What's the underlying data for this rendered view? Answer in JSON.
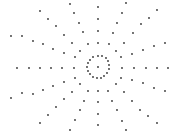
{
  "figure": {
    "width": 174,
    "height": 138,
    "background": "#ffffff",
    "dot_color": "#333333",
    "dot_radius": 0.9,
    "center": [
      98,
      67
    ],
    "inner_ring": [
      [
        98,
        56
      ],
      [
        102,
        56
      ],
      [
        106,
        58
      ],
      [
        108,
        61
      ],
      [
        109,
        65
      ],
      [
        109,
        69
      ],
      [
        107,
        73
      ],
      [
        104,
        76
      ],
      [
        101,
        78
      ],
      [
        97,
        78
      ],
      [
        93,
        77
      ],
      [
        90,
        74
      ],
      [
        88,
        71
      ],
      [
        87,
        67
      ],
      [
        88,
        63
      ],
      [
        90,
        60
      ],
      [
        93,
        57
      ]
    ],
    "center_dot": [
      98,
      67
    ],
    "rays": [
      [
        [
          98,
          43
        ],
        [
          98,
          31
        ],
        [
          98,
          19
        ],
        [
          98,
          7
        ]
      ],
      [
        [
          98,
          91
        ],
        [
          98,
          102
        ],
        [
          98,
          114
        ],
        [
          98,
          125
        ]
      ],
      [
        [
          74,
          68
        ],
        [
          62,
          68
        ],
        [
          51,
          68
        ],
        [
          40,
          68
        ],
        [
          29,
          68
        ],
        [
          17,
          68
        ]
      ],
      [
        [
          122,
          68
        ],
        [
          134,
          68
        ],
        [
          146,
          68
        ],
        [
          157,
          68
        ],
        [
          168,
          68
        ]
      ],
      [
        [
          88,
          44
        ],
        [
          83,
          32
        ],
        [
          79,
          23
        ],
        [
          74,
          13
        ],
        [
          70,
          4
        ]
      ],
      [
        [
          109,
          44
        ],
        [
          113,
          33
        ],
        [
          117,
          23
        ],
        [
          122,
          13
        ],
        [
          126,
          3
        ]
      ],
      [
        [
          80,
          51
        ],
        [
          72,
          43
        ],
        [
          64,
          35
        ],
        [
          56,
          26
        ],
        [
          48,
          19
        ],
        [
          40,
          11
        ]
      ],
      [
        [
          116,
          51
        ],
        [
          124,
          43
        ],
        [
          133,
          33
        ],
        [
          141,
          24
        ],
        [
          149,
          18
        ],
        [
          157,
          10
        ]
      ],
      [
        [
          75,
          57
        ],
        [
          64,
          53
        ],
        [
          53,
          49
        ],
        [
          43,
          44
        ],
        [
          33,
          41
        ],
        [
          22,
          36
        ],
        [
          11,
          36
        ]
      ],
      [
        [
          121,
          57
        ],
        [
          132,
          54
        ],
        [
          143,
          50
        ],
        [
          154,
          46
        ],
        [
          165,
          43
        ]
      ],
      [
        [
          75,
          78
        ],
        [
          64,
          82
        ],
        [
          53,
          86
        ],
        [
          43,
          90
        ],
        [
          33,
          94
        ],
        [
          22,
          93
        ],
        [
          11,
          98
        ]
      ],
      [
        [
          121,
          78
        ],
        [
          132,
          80
        ],
        [
          143,
          83
        ],
        [
          154,
          88
        ],
        [
          165,
          91
        ]
      ],
      [
        [
          80,
          84
        ],
        [
          72,
          92
        ],
        [
          64,
          99
        ],
        [
          56,
          107
        ],
        [
          48,
          115
        ],
        [
          40,
          123
        ]
      ],
      [
        [
          116,
          84
        ],
        [
          124,
          92
        ],
        [
          132,
          101
        ],
        [
          140,
          110
        ],
        [
          148,
          116
        ],
        [
          157,
          123
        ]
      ],
      [
        [
          88,
          91
        ],
        [
          84,
          101
        ],
        [
          80,
          110
        ],
        [
          75,
          120
        ],
        [
          70,
          130
        ]
      ],
      [
        [
          108,
          91
        ],
        [
          112,
          101
        ],
        [
          117,
          110
        ],
        [
          122,
          121
        ],
        [
          126,
          130
        ]
      ]
    ]
  }
}
